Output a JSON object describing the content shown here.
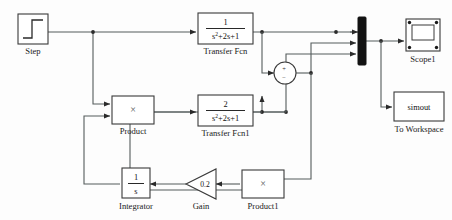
{
  "diagram": {
    "background": "#fdfdfd",
    "line_color": "#555c5c",
    "block_stroke": "#3a3a3a"
  },
  "blocks": {
    "step": {
      "label": "Step",
      "type": "step-source",
      "icon": "step-waveform"
    },
    "transfer_fcn": {
      "label": "Transfer Fcn",
      "numerator": "1",
      "denominator_base": "s",
      "denominator_sup": "2",
      "denominator_rest": "+2s+1",
      "denominator_full": "s^2+2s+1"
    },
    "transfer_fcn1": {
      "label": "Transfer Fcn1",
      "numerator": "2",
      "denominator_base": "s",
      "denominator_sup": "2",
      "denominator_rest": "+2s+1",
      "denominator_full": "s^2+2s+1"
    },
    "product": {
      "label": "Product",
      "symbol": "×"
    },
    "product1": {
      "label": "Product1",
      "symbol": "×"
    },
    "sum": {
      "label": "",
      "plus_sign": "+",
      "minus_sign": "−"
    },
    "integrator": {
      "label": "Integrator",
      "numerator": "1",
      "denominator": "s"
    },
    "gain": {
      "label": "Gain",
      "value": "0.2"
    },
    "mux": {
      "label": "",
      "inputs": 3
    },
    "scope1": {
      "label": "Scope1",
      "type": "scope-sink"
    },
    "to_workspace": {
      "label": "To Workspace",
      "variable": "simout"
    }
  }
}
